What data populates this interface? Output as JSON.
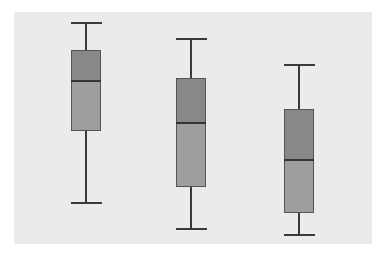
{
  "chart_data": {
    "type": "box",
    "title": "",
    "xlabel": "",
    "ylabel": "",
    "ylim": [
      0,
      100
    ],
    "grid": false,
    "legend": null,
    "categories": [
      "Group 1",
      "Group 2",
      "Group 3"
    ],
    "series": [
      {
        "name": "Group 1",
        "min": 17.7,
        "q1": 48.7,
        "median": 70.3,
        "q3": 83.6,
        "max": 95.3
      },
      {
        "name": "Group 2",
        "min": 6.5,
        "q1": 24.6,
        "median": 52.2,
        "q3": 71.6,
        "max": 88.4
      },
      {
        "name": "Group 3",
        "min": 3.9,
        "q1": 13.4,
        "median": 36.2,
        "q3": 58.2,
        "max": 77.2
      }
    ]
  },
  "style": {
    "plot_background": "#ebebeb",
    "upper_box_color": "#888888",
    "lower_box_color": "#9e9e9e",
    "line_color": "#3a3a3a"
  },
  "layout": {
    "box_centers_px": [
      72,
      177,
      285
    ],
    "box_width_px": 30,
    "cap_width_px": 31
  }
}
